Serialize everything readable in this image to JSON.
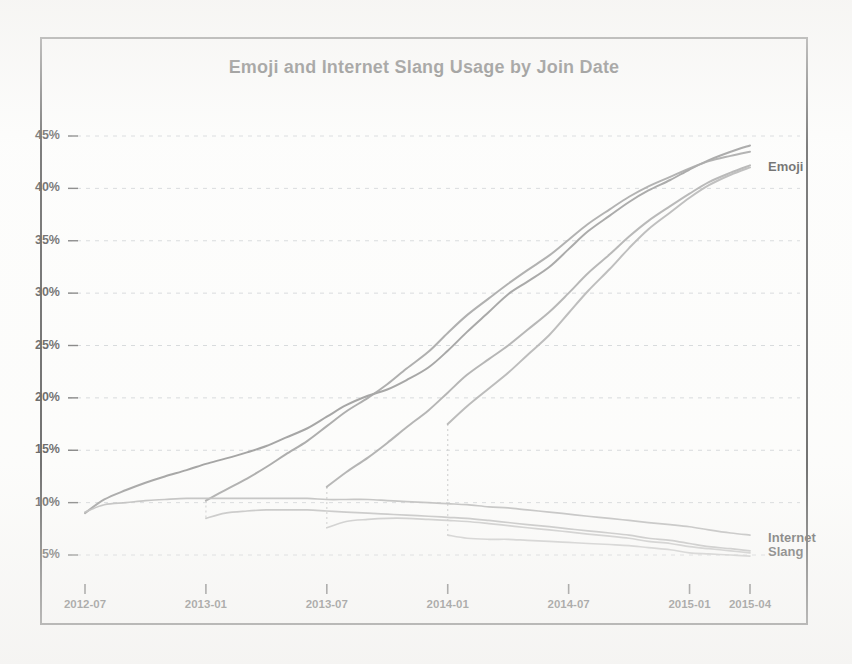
{
  "chart_data": {
    "type": "line",
    "title": "Emoji and Internet Slang Usage by Join Date",
    "xlabel": "",
    "ylabel": "",
    "grid": true,
    "legend_position": "right-inline-labels",
    "xlim": [
      "2012-07",
      "2015-04"
    ],
    "ylim": [
      3.5,
      46.5
    ],
    "ytick_labels": [
      "45%",
      "40%",
      "35%",
      "30%",
      "25%",
      "20%",
      "15%",
      "10%",
      "5%"
    ],
    "ytick_values": [
      45,
      40,
      35,
      30,
      25,
      20,
      15,
      10,
      5
    ],
    "xtick_labels": [
      "2012-07",
      "2013-01",
      "2013-07",
      "2014-01",
      "2014-07",
      "2015-01",
      "2015-04"
    ],
    "xtick_values": [
      2012.5,
      2013.0,
      2013.5,
      2014.0,
      2014.5,
      2015.0,
      2015.25
    ],
    "inline_labels": [
      {
        "text": "Emoji",
        "x": 2015.3,
        "y": 42.0
      },
      {
        "text": "Internet",
        "x": 2015.3,
        "y": 6.6
      },
      {
        "text": "Slang",
        "x": 2015.3,
        "y": 5.3
      }
    ],
    "series": [
      {
        "name": "Emoji — joined 2012-07",
        "group": "Emoji",
        "cohort": "2012-07",
        "color": "#6d6d6d",
        "x": [
          2012.5,
          2012.58,
          2012.67,
          2012.75,
          2012.83,
          2012.92,
          2013.0,
          2013.08,
          2013.17,
          2013.25,
          2013.33,
          2013.42,
          2013.5,
          2013.58,
          2013.67,
          2013.75,
          2013.83,
          2013.92,
          2014.0,
          2014.08,
          2014.17,
          2014.25,
          2014.33,
          2014.42,
          2014.5,
          2014.58,
          2014.67,
          2014.75,
          2014.83,
          2014.92,
          2015.0,
          2015.08,
          2015.17,
          2015.25
        ],
        "values": [
          9.0,
          10.3,
          11.2,
          11.9,
          12.5,
          13.1,
          13.7,
          14.2,
          14.8,
          15.4,
          16.2,
          17.1,
          18.2,
          19.3,
          20.2,
          20.8,
          21.7,
          22.9,
          24.5,
          26.3,
          28.2,
          29.9,
          31.1,
          32.5,
          34.2,
          35.9,
          37.4,
          38.7,
          39.8,
          40.8,
          41.8,
          42.7,
          43.5,
          44.1
        ]
      },
      {
        "name": "Emoji — joined 2013-01",
        "group": "Emoji",
        "cohort": "2013-01",
        "color": "#7a7a7a",
        "x": [
          2013.0,
          2013.08,
          2013.17,
          2013.25,
          2013.33,
          2013.42,
          2013.5,
          2013.58,
          2013.67,
          2013.75,
          2013.83,
          2013.92,
          2014.0,
          2014.08,
          2014.17,
          2014.25,
          2014.33,
          2014.42,
          2014.5,
          2014.58,
          2014.67,
          2014.75,
          2014.83,
          2014.92,
          2015.0,
          2015.08,
          2015.17,
          2015.25
        ],
        "values": [
          10.2,
          11.2,
          12.3,
          13.4,
          14.6,
          15.9,
          17.3,
          18.7,
          20.0,
          21.3,
          22.8,
          24.4,
          26.2,
          27.9,
          29.5,
          30.9,
          32.2,
          33.6,
          35.1,
          36.6,
          38.0,
          39.2,
          40.2,
          41.1,
          41.9,
          42.6,
          43.1,
          43.5
        ]
      },
      {
        "name": "Emoji — joined 2013-07",
        "group": "Emoji",
        "cohort": "2013-07",
        "color": "#868686",
        "x": [
          2013.5,
          2013.58,
          2013.67,
          2013.75,
          2013.83,
          2013.92,
          2014.0,
          2014.08,
          2014.17,
          2014.25,
          2014.33,
          2014.42,
          2014.5,
          2014.58,
          2014.67,
          2014.75,
          2014.83,
          2014.92,
          2015.0,
          2015.08,
          2015.17,
          2015.25
        ],
        "values": [
          11.5,
          12.9,
          14.3,
          15.7,
          17.2,
          18.8,
          20.5,
          22.2,
          23.7,
          25.0,
          26.5,
          28.2,
          30.0,
          31.9,
          33.7,
          35.4,
          36.9,
          38.3,
          39.5,
          40.6,
          41.5,
          42.2
        ]
      },
      {
        "name": "Emoji — joined 2014-01",
        "group": "Emoji",
        "cohort": "2014-01",
        "color": "#909090",
        "x": [
          2014.0,
          2014.08,
          2014.17,
          2014.25,
          2014.33,
          2014.42,
          2014.5,
          2014.58,
          2014.67,
          2014.75,
          2014.83,
          2014.92,
          2015.0,
          2015.08,
          2015.17,
          2015.25
        ],
        "values": [
          17.5,
          19.2,
          20.9,
          22.4,
          24.1,
          26.0,
          28.1,
          30.2,
          32.3,
          34.3,
          36.1,
          37.7,
          39.1,
          40.3,
          41.3,
          42.0
        ]
      },
      {
        "name": "Internet Slang — joined 2012-07",
        "group": "Internet Slang",
        "cohort": "2012-07",
        "color": "#9a9a9a",
        "x": [
          2012.5,
          2012.58,
          2012.67,
          2012.75,
          2012.83,
          2012.92,
          2013.0,
          2013.08,
          2013.17,
          2013.25,
          2013.33,
          2013.42,
          2013.5,
          2013.58,
          2013.67,
          2013.75,
          2013.83,
          2013.92,
          2014.0,
          2014.08,
          2014.17,
          2014.25,
          2014.33,
          2014.42,
          2014.5,
          2014.58,
          2014.67,
          2014.75,
          2014.83,
          2014.92,
          2015.0,
          2015.08,
          2015.17,
          2015.25
        ],
        "values": [
          9.1,
          9.8,
          10.0,
          10.2,
          10.3,
          10.4,
          10.4,
          10.4,
          10.4,
          10.4,
          10.4,
          10.4,
          10.3,
          10.3,
          10.3,
          10.2,
          10.1,
          10.0,
          9.9,
          9.8,
          9.6,
          9.5,
          9.3,
          9.1,
          8.9,
          8.7,
          8.5,
          8.3,
          8.1,
          7.9,
          7.7,
          7.4,
          7.1,
          6.9
        ]
      },
      {
        "name": "Internet Slang — joined 2013-01",
        "group": "Internet Slang",
        "cohort": "2013-01",
        "color": "#a2a2a2",
        "x": [
          2013.0,
          2013.08,
          2013.17,
          2013.25,
          2013.33,
          2013.42,
          2013.5,
          2013.58,
          2013.67,
          2013.75,
          2013.83,
          2013.92,
          2014.0,
          2014.08,
          2014.17,
          2014.25,
          2014.33,
          2014.42,
          2014.5,
          2014.58,
          2014.67,
          2014.75,
          2014.83,
          2014.92,
          2015.0,
          2015.08,
          2015.17,
          2015.25
        ],
        "values": [
          8.5,
          9.0,
          9.2,
          9.3,
          9.3,
          9.3,
          9.2,
          9.1,
          9.0,
          8.9,
          8.8,
          8.7,
          8.6,
          8.5,
          8.3,
          8.1,
          7.9,
          7.7,
          7.5,
          7.3,
          7.1,
          6.9,
          6.6,
          6.4,
          6.1,
          5.8,
          5.6,
          5.4
        ]
      },
      {
        "name": "Internet Slang — joined 2013-07",
        "group": "Internet Slang",
        "cohort": "2013-07",
        "color": "#acacac",
        "x": [
          2013.5,
          2013.58,
          2013.67,
          2013.75,
          2013.83,
          2013.92,
          2014.0,
          2014.08,
          2014.17,
          2014.25,
          2014.33,
          2014.42,
          2014.5,
          2014.58,
          2014.67,
          2014.75,
          2014.83,
          2014.92,
          2015.0,
          2015.08,
          2015.17,
          2015.25
        ],
        "values": [
          7.6,
          8.2,
          8.4,
          8.5,
          8.5,
          8.4,
          8.3,
          8.2,
          8.0,
          7.8,
          7.6,
          7.4,
          7.2,
          7.0,
          6.8,
          6.6,
          6.3,
          6.1,
          5.8,
          5.6,
          5.4,
          5.2
        ]
      },
      {
        "name": "Internet Slang — joined 2014-01",
        "group": "Internet Slang",
        "cohort": "2014-01",
        "color": "#b2b2b2",
        "x": [
          2014.0,
          2014.08,
          2014.17,
          2014.25,
          2014.33,
          2014.42,
          2014.5,
          2014.58,
          2014.67,
          2014.75,
          2014.83,
          2014.92,
          2015.0,
          2015.08,
          2015.17,
          2015.25
        ],
        "values": [
          6.9,
          6.6,
          6.5,
          6.5,
          6.4,
          6.3,
          6.2,
          6.1,
          6.0,
          5.9,
          5.7,
          5.5,
          5.2,
          5.1,
          5.0,
          4.9
        ]
      }
    ],
    "cohort_connectors": [
      {
        "cohort": "2013-01",
        "x": 2013.0,
        "y_top": 10.2,
        "y_bottom": 8.5
      },
      {
        "cohort": "2013-07",
        "x": 2013.5,
        "y_top": 11.5,
        "y_bottom": 7.6
      },
      {
        "cohort": "2014-01",
        "x": 2014.0,
        "y_top": 17.5,
        "y_bottom": 6.9
      }
    ]
  }
}
